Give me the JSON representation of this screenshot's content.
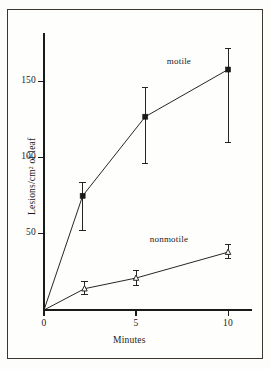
{
  "figure": {
    "background_color": "#fefefc",
    "border_color": "#3a352e",
    "ink_color": "#1a1a1a"
  },
  "chart_data": {
    "type": "line",
    "title": "",
    "subtitle": "",
    "xlabel": "Minutes",
    "ylabel": "Lesions/cm² of leaf",
    "xlim": [
      0,
      11.3
    ],
    "ylim": [
      0,
      182
    ],
    "xticks": [
      0,
      5,
      10
    ],
    "xticklabels": [
      "0",
      "5",
      "10"
    ],
    "yticks": [
      50,
      100,
      150
    ],
    "yticklabels": [
      "50",
      "100",
      "150"
    ],
    "grid": false,
    "legend_position": "inline-annotations",
    "series": [
      {
        "name": "motile",
        "marker": "filled-square",
        "label_text": "motile",
        "label_x": 7.0,
        "label_y": 163,
        "x": [
          0,
          2.1,
          5.5,
          10
        ],
        "values": [
          0,
          75,
          127,
          158
        ],
        "err_low": [
          0,
          52,
          96,
          110
        ],
        "err_high": [
          0,
          84,
          146,
          172
        ]
      },
      {
        "name": "nonmotile",
        "marker": "open-triangle",
        "label_text": "nonmotile",
        "label_x": 6.4,
        "label_y": 46,
        "x": [
          0,
          2.2,
          5.0,
          10
        ],
        "values": [
          0,
          14,
          21,
          38
        ],
        "err_low": [
          0,
          10,
          16,
          34
        ],
        "err_high": [
          0,
          19,
          26,
          43
        ]
      }
    ],
    "annotations": [
      {
        "text": "motile",
        "series": "motile"
      },
      {
        "text": "nonmotile",
        "series": "nonmotile"
      }
    ]
  }
}
